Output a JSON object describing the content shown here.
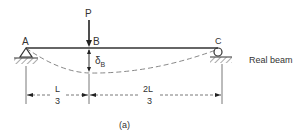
{
  "diagram": {
    "caption": "(a)",
    "beam_label": "Real beam",
    "points": {
      "A": "A",
      "B": "B",
      "C": "C"
    },
    "load": {
      "label": "P"
    },
    "deflection": {
      "symbol": "δ",
      "subscript": "B"
    },
    "dimensions": [
      {
        "numerator": "L",
        "denominator": "3"
      },
      {
        "numerator": "2L",
        "denominator": "3"
      }
    ],
    "colors": {
      "line": "#333333",
      "dashed": "#888888"
    }
  }
}
